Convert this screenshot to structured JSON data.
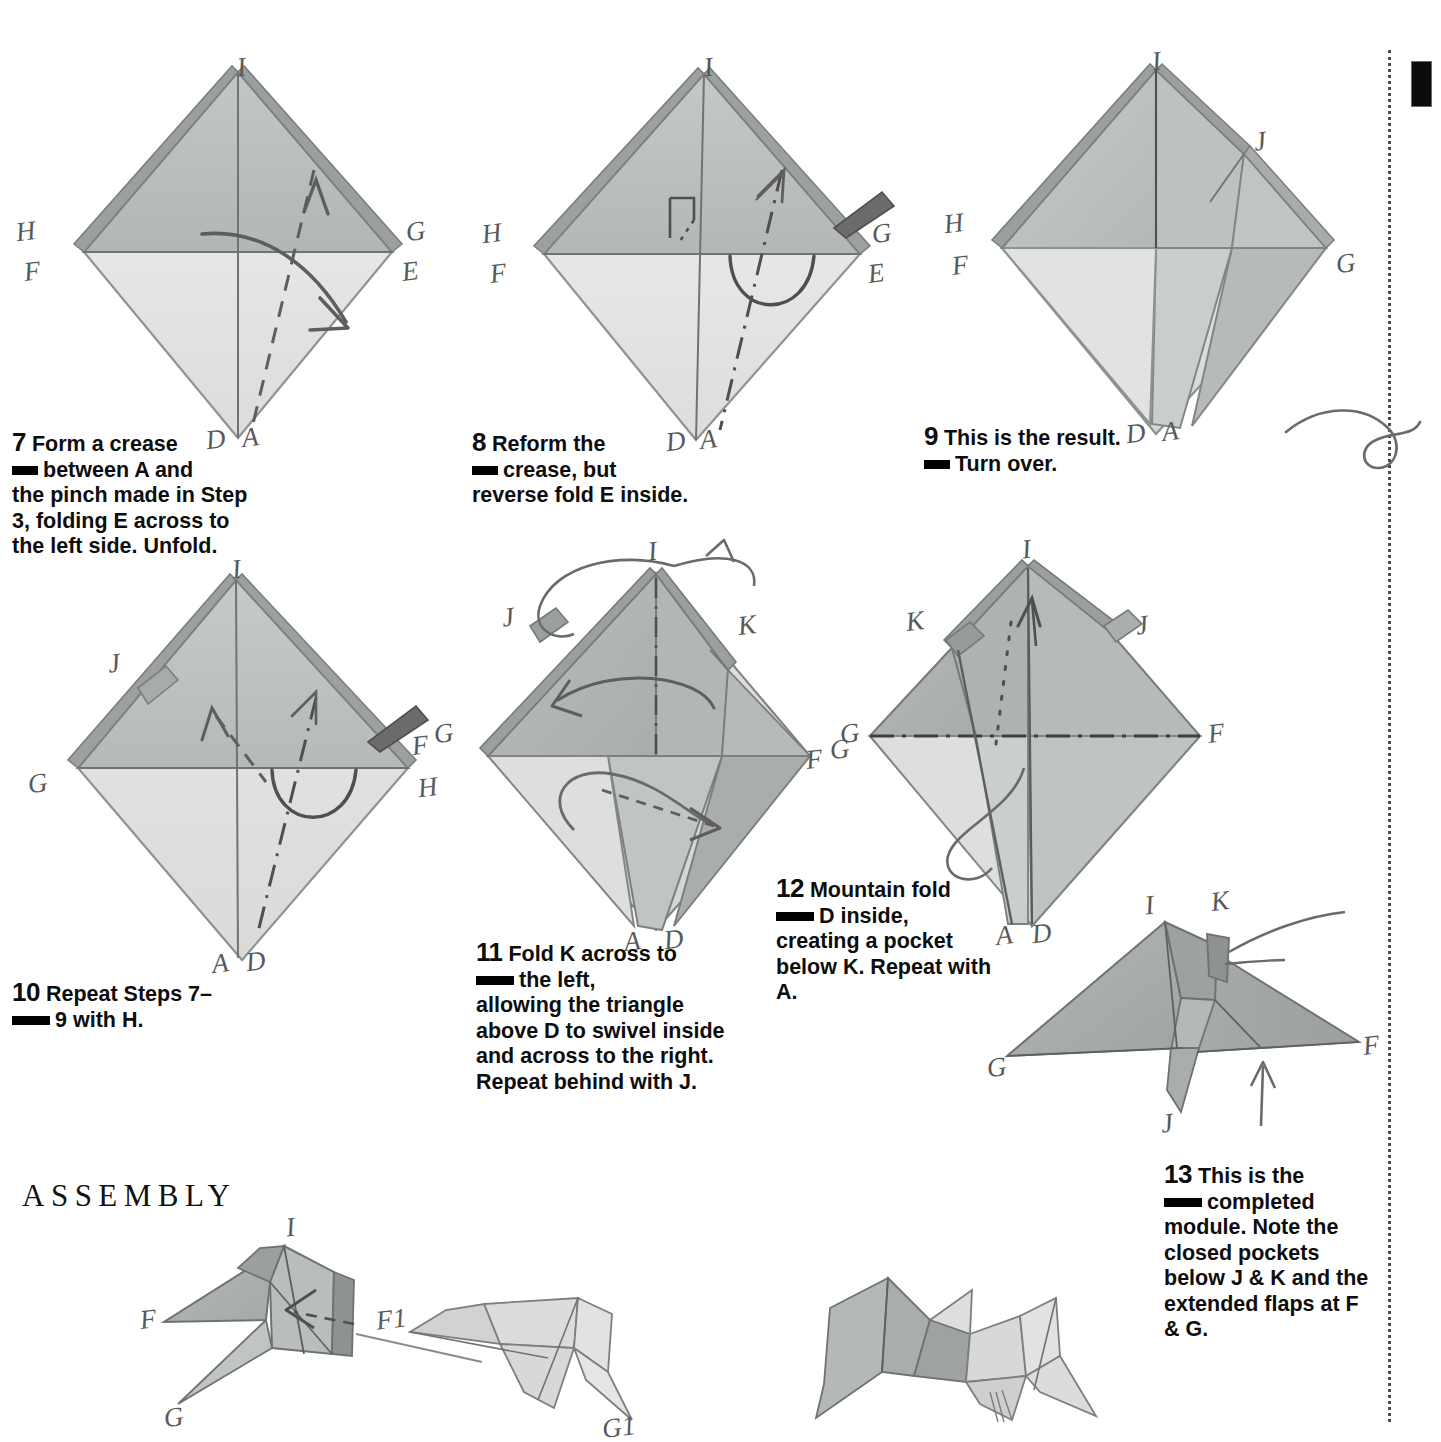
{
  "page": {
    "section_heading": "ASSEMBLY",
    "paper": {
      "front_light": "#e3e3e1",
      "front_mid": "#b9bdbc",
      "front_dark": "#9fa4a3",
      "back_shadow": "#8d9291",
      "ink": "#5d5d5e",
      "edge": "#6e7373"
    }
  },
  "steps": [
    {
      "number": "7",
      "line1": "Form a crease",
      "line2": "between A and",
      "rest": "the pinch made in Step 3, folding E across to the left side. Unfold."
    },
    {
      "number": "8",
      "line1": "Reform the",
      "line2": "crease, but",
      "rest": "reverse fold E inside."
    },
    {
      "number": "9",
      "line1": "This is the result.",
      "line2": "Turn over.",
      "rest": ""
    },
    {
      "number": "10",
      "line1": "Repeat Steps 7–",
      "line2": "9 with H.",
      "rest": ""
    },
    {
      "number": "11",
      "line1": "Fold K across to",
      "line2": "the left,",
      "rest": "allowing the triangle above D to swivel inside and across to the right. Repeat behind with J."
    },
    {
      "number": "12",
      "line1": "Mountain fold",
      "line2": "D inside,",
      "rest": "creating a pocket below K. Repeat with A."
    },
    {
      "number": "13",
      "line1": "This is the",
      "line2": "completed",
      "rest": "module. Note the closed pockets below J & K and the extended flaps at F & G."
    }
  ],
  "diagrams": {
    "d7": {
      "name": "step-7-kite",
      "labels": [
        {
          "text": "I",
          "x": 213,
          "y": 22
        },
        {
          "text": "H",
          "x": 14,
          "y": 190
        },
        {
          "text": "F",
          "x": 22,
          "y": 233
        },
        {
          "text": "G",
          "x": 406,
          "y": 192
        },
        {
          "text": "E",
          "x": 396,
          "y": 232
        },
        {
          "text": "D",
          "x": 193,
          "y": 410
        },
        {
          "text": "A",
          "x": 228,
          "y": 408
        }
      ]
    },
    "d8": {
      "name": "step-8-kite",
      "labels": [
        {
          "text": "I",
          "x": 224,
          "y": 22
        },
        {
          "text": "H",
          "x": 22,
          "y": 190
        },
        {
          "text": "F",
          "x": 28,
          "y": 235
        },
        {
          "text": "G",
          "x": 404,
          "y": 194
        },
        {
          "text": "E",
          "x": 398,
          "y": 234
        },
        {
          "text": "D",
          "x": 200,
          "y": 408
        },
        {
          "text": "A",
          "x": 234,
          "y": 406
        }
      ]
    },
    "d9": {
      "name": "step-9-kite",
      "labels": [
        {
          "text": "I",
          "x": 214,
          "y": 20
        },
        {
          "text": "J",
          "x": 322,
          "y": 108
        },
        {
          "text": "H",
          "x": 12,
          "y": 186
        },
        {
          "text": "F",
          "x": 22,
          "y": 230
        },
        {
          "text": "G",
          "x": 402,
          "y": 232
        },
        {
          "text": "D",
          "x": 196,
          "y": 406
        },
        {
          "text": "A",
          "x": 232,
          "y": 404
        }
      ]
    },
    "d10": {
      "name": "step-10-kite",
      "labels": [
        {
          "text": "I",
          "x": 212,
          "y": 20
        },
        {
          "text": "J",
          "x": 96,
          "y": 114
        },
        {
          "text": "G",
          "x": 10,
          "y": 244
        },
        {
          "text": "F",
          "x": 390,
          "y": 210
        },
        {
          "text": "G",
          "x": 418,
          "y": 200
        },
        {
          "text": "H",
          "x": 398,
          "y": 250
        },
        {
          "text": "A",
          "x": 196,
          "y": 434
        },
        {
          "text": "D",
          "x": 230,
          "y": 432
        }
      ]
    },
    "d11": {
      "name": "step-11-kite",
      "labels": [
        {
          "text": "I",
          "x": 218,
          "y": 6
        },
        {
          "text": "J",
          "x": 42,
          "y": 92
        },
        {
          "text": "K",
          "x": 330,
          "y": 98
        },
        {
          "text": "G",
          "x": 404,
          "y": 200
        },
        {
          "text": "F",
          "x": 378,
          "y": 214
        },
        {
          "text": "A",
          "x": 182,
          "y": 382
        },
        {
          "text": "D",
          "x": 224,
          "y": 380
        }
      ]
    },
    "d12": {
      "name": "step-12-kite",
      "labels": [
        {
          "text": "I",
          "x": 202,
          "y": 6
        },
        {
          "text": "K",
          "x": 78,
          "y": 82
        },
        {
          "text": "J",
          "x": 318,
          "y": 90
        },
        {
          "text": "G",
          "x": 6,
          "y": 196
        },
        {
          "text": "F",
          "x": 390,
          "y": 198
        },
        {
          "text": "A",
          "x": 180,
          "y": 378
        },
        {
          "text": "D",
          "x": 214,
          "y": 378
        }
      ]
    },
    "d13": {
      "name": "step-13-module",
      "labels": [
        {
          "text": "I",
          "x": 158,
          "y": 2
        },
        {
          "text": "K",
          "x": 224,
          "y": 0
        },
        {
          "text": "G",
          "x": 8,
          "y": 170
        },
        {
          "text": "F",
          "x": 378,
          "y": 160
        },
        {
          "text": "J",
          "x": 168,
          "y": 228
        }
      ]
    },
    "a1": {
      "name": "assembly-module-left",
      "labels": [
        {
          "text": "I",
          "x": 180,
          "y": 0
        },
        {
          "text": "F",
          "x": 0,
          "y": 84
        },
        {
          "text": "G",
          "x": 56,
          "y": 190
        }
      ]
    },
    "a2": {
      "name": "assembly-module-right",
      "labels": [
        {
          "text": "F1",
          "x": 0,
          "y": 60
        },
        {
          "text": "G1",
          "x": 198,
          "y": 192
        }
      ]
    },
    "a3": {
      "name": "assembly-joined-pair",
      "labels": []
    }
  }
}
